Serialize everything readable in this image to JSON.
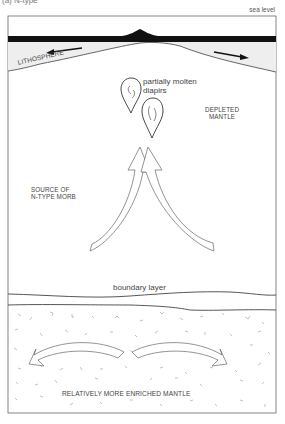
{
  "figure": {
    "panel_label": "(a) N-type",
    "sea_level_label": "sea level",
    "lithosphere_label": "LITHOSPHERE",
    "diapirs_label_line1": "partially molten",
    "diapirs_label_line2": "diapirs",
    "depleted_mantle_line1": "DEPLETED",
    "depleted_mantle_line2": "MANTLE",
    "source_line1": "SOURCE OF",
    "source_line2": "N-TYPE MORB",
    "boundary_layer_label": "boundary layer",
    "enriched_mantle_label": "RELATIVELY MORE ENRICHED MANTLE"
  },
  "colors": {
    "ocean_crust": "#111111",
    "lithosphere_fill": "#eeeeee",
    "outline": "#555555",
    "speckle": "#999999"
  }
}
